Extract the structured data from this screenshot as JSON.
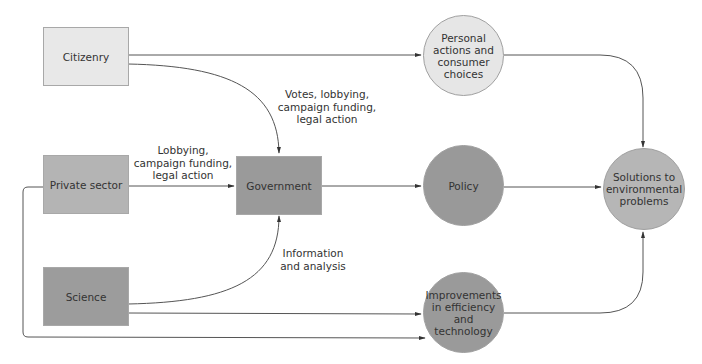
{
  "diagram": {
    "nodes": {
      "citizenry": {
        "label": "Citizenry",
        "shape": "rect",
        "color": "#e8e8e8"
      },
      "private_sector": {
        "label": "Private sector",
        "shape": "rect",
        "color": "#b4b4b4"
      },
      "science": {
        "label": "Science",
        "shape": "rect",
        "color": "#9c9c9c"
      },
      "government": {
        "label": "Government",
        "shape": "rect",
        "color": "#9a9a9a"
      },
      "personal_actions": {
        "label": "Personal actions and consumer choices",
        "shape": "circle",
        "color": "#e6e6e6"
      },
      "policy": {
        "label": "Policy",
        "shape": "circle",
        "color": "#999999"
      },
      "improvements": {
        "label": "Improvements in efficiency and technology",
        "shape": "circle",
        "color": "#9a9a9a"
      },
      "solutions": {
        "label": "Solutions to environmental problems",
        "shape": "circle",
        "color": "#b6b6b6"
      }
    },
    "edge_labels": {
      "citizenry_to_government": [
        "Votes, lobbying,",
        "campaign funding,",
        "legal action"
      ],
      "private_to_government": [
        "Lobbying,",
        "campaign funding,",
        "legal action"
      ],
      "science_to_government": [
        "Information",
        "and analysis"
      ]
    },
    "edges": [
      {
        "from": "citizenry",
        "to": "personal_actions"
      },
      {
        "from": "citizenry",
        "to": "government",
        "label": "Votes, lobbying, campaign funding, legal action"
      },
      {
        "from": "private_sector",
        "to": "government",
        "label": "Lobbying, campaign funding, legal action"
      },
      {
        "from": "science",
        "to": "government",
        "label": "Information and analysis"
      },
      {
        "from": "government",
        "to": "policy"
      },
      {
        "from": "science",
        "to": "improvements"
      },
      {
        "from": "private_sector",
        "to": "improvements"
      },
      {
        "from": "personal_actions",
        "to": "solutions"
      },
      {
        "from": "policy",
        "to": "solutions"
      },
      {
        "from": "improvements",
        "to": "solutions"
      }
    ]
  }
}
